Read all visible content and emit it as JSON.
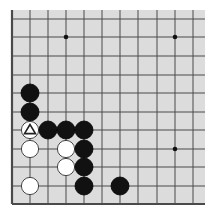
{
  "board": {
    "background": "#dcdcdc",
    "line_color": "#4a4a4a",
    "area": {
      "x": 12,
      "y": 10,
      "w": 193,
      "h": 194
    },
    "columns_x": [
      12,
      30,
      48,
      66,
      84,
      102,
      120,
      138,
      157,
      175,
      193
    ],
    "rows_y": [
      19,
      37,
      56,
      75,
      93,
      112,
      130,
      149,
      167,
      186,
      204
    ],
    "left_edge": true,
    "bottom_edge": true,
    "star_points": [
      [
        3,
        1
      ],
      [
        9,
        1
      ],
      [
        9,
        7
      ]
    ],
    "stone_radius": 9
  },
  "stones": [
    {
      "color": "black",
      "col": 1,
      "row": 4
    },
    {
      "color": "black",
      "col": 1,
      "row": 5
    },
    {
      "color": "white",
      "col": 1,
      "row": 6,
      "marker": "triangle"
    },
    {
      "color": "black",
      "col": 2,
      "row": 6
    },
    {
      "color": "black",
      "col": 3,
      "row": 6
    },
    {
      "color": "black",
      "col": 4,
      "row": 6
    },
    {
      "color": "white",
      "col": 1,
      "row": 7
    },
    {
      "color": "white",
      "col": 3,
      "row": 7
    },
    {
      "color": "black",
      "col": 4,
      "row": 7
    },
    {
      "color": "white",
      "col": 3,
      "row": 8
    },
    {
      "color": "black",
      "col": 4,
      "row": 8
    },
    {
      "color": "white",
      "col": 1,
      "row": 9
    },
    {
      "color": "black",
      "col": 4,
      "row": 9
    },
    {
      "color": "black",
      "col": 6,
      "row": 9
    }
  ]
}
